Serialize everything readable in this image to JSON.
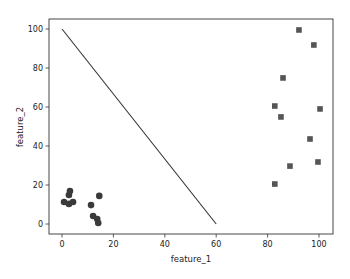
{
  "chart_data": {
    "type": "scatter",
    "title": "",
    "xlabel": "feature_1",
    "ylabel": "feature_2",
    "xlim": [
      -5,
      105
    ],
    "ylim": [
      -5,
      105
    ],
    "xticks": [
      0,
      20,
      40,
      60,
      80,
      100
    ],
    "yticks": [
      0,
      20,
      40,
      60,
      80,
      100
    ],
    "grid": false,
    "legend": null,
    "colors": {
      "points": "#3a3a3a",
      "line": "#333333",
      "spine": "#333333"
    },
    "series": [
      {
        "name": "class_0",
        "marker": "circle",
        "points": [
          [
            0.8,
            11.3
          ],
          [
            2.7,
            14.9
          ],
          [
            3.1,
            16.9
          ],
          [
            2.7,
            10.3
          ],
          [
            4.3,
            11.3
          ],
          [
            14.5,
            14.4
          ],
          [
            11.3,
            9.7
          ],
          [
            12.1,
            4.1
          ],
          [
            13.7,
            2.6
          ],
          [
            14.1,
            0.5
          ]
        ]
      },
      {
        "name": "class_1",
        "marker": "square",
        "points": [
          [
            92.2,
            99.5
          ],
          [
            98.0,
            91.8
          ],
          [
            86.0,
            74.9
          ],
          [
            82.8,
            60.5
          ],
          [
            85.2,
            54.9
          ],
          [
            100.4,
            59.0
          ],
          [
            96.5,
            43.6
          ],
          [
            99.6,
            31.8
          ],
          [
            88.7,
            29.7
          ],
          [
            82.8,
            20.5
          ]
        ]
      },
      {
        "name": "decision_line",
        "type": "line",
        "points": [
          [
            0,
            100
          ],
          [
            60,
            0
          ]
        ]
      }
    ]
  }
}
